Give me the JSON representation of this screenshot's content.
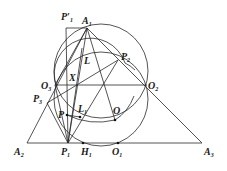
{
  "diagram": {
    "points": [
      {
        "id": "A1",
        "label": "A",
        "sub": "1",
        "x": 87,
        "y": 28,
        "lx": 82,
        "ly": 24
      },
      {
        "id": "A2",
        "label": "A",
        "sub": "2",
        "x": 27,
        "y": 143,
        "lx": 14,
        "ly": 155
      },
      {
        "id": "A3",
        "label": "A",
        "sub": "3",
        "x": 202,
        "y": 143,
        "lx": 204,
        "ly": 155
      },
      {
        "id": "P1p",
        "label": "P′",
        "sub": "1",
        "x": 66,
        "y": 28,
        "lx": 61,
        "ly": 20
      },
      {
        "id": "P1",
        "label": "P",
        "sub": "1",
        "x": 68,
        "y": 143,
        "lx": 61,
        "ly": 155
      },
      {
        "id": "P2",
        "label": "P",
        "sub": "2",
        "x": 118,
        "y": 60,
        "lx": 121,
        "ly": 60
      },
      {
        "id": "P3",
        "label": "P",
        "sub": "3",
        "x": 47,
        "y": 103,
        "lx": 33,
        "ly": 102
      },
      {
        "id": "O1",
        "label": "O",
        "sub": "1",
        "x": 118,
        "y": 143,
        "lx": 112,
        "ly": 155
      },
      {
        "id": "O2",
        "label": "O",
        "sub": "2",
        "x": 147,
        "y": 85,
        "lx": 148,
        "ly": 89
      },
      {
        "id": "O3",
        "label": "O",
        "sub": "3",
        "x": 55,
        "y": 85,
        "lx": 41,
        "ly": 89
      },
      {
        "id": "H1",
        "label": "H",
        "sub": "1",
        "x": 83,
        "y": 143,
        "lx": 81,
        "ly": 155
      },
      {
        "id": "X",
        "label": "X",
        "sub": "",
        "x": 73,
        "y": 85,
        "lx": 69,
        "ly": 81
      },
      {
        "id": "L",
        "label": "L",
        "sub": "",
        "x": 82,
        "y": 48,
        "lx": 84,
        "ly": 64
      },
      {
        "id": "L1",
        "label": "L",
        "sub": "1",
        "x": 80,
        "y": 117,
        "lx": 78,
        "ly": 112
      },
      {
        "id": "P",
        "label": "P",
        "sub": "",
        "x": 67,
        "y": 115,
        "lx": 58,
        "ly": 118
      },
      {
        "id": "O",
        "label": "O",
        "sub": "",
        "x": 115,
        "y": 120,
        "lx": 113,
        "ly": 114
      }
    ]
  }
}
